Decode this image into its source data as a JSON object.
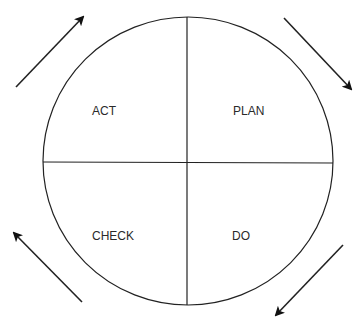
{
  "diagram": {
    "quadrants": [
      {
        "id": "act",
        "label": "ACT",
        "x": 92,
        "y": 115
      },
      {
        "id": "plan",
        "label": "PLAN",
        "x": 233,
        "y": 115
      },
      {
        "id": "check",
        "label": "CHECK",
        "x": 92,
        "y": 240
      },
      {
        "id": "do",
        "label": "DO",
        "x": 232,
        "y": 240
      }
    ],
    "circle": {
      "cx": 188,
      "cy": 161,
      "rx": 145,
      "ry": 144
    },
    "arrows": [
      {
        "id": "act-to-plan",
        "from": [
          16,
          87
        ],
        "to": [
          83,
          16
        ]
      },
      {
        "id": "plan-to-do",
        "from": [
          284,
          18
        ],
        "to": [
          352,
          90
        ]
      },
      {
        "id": "do-to-check",
        "from": [
          343,
          245
        ],
        "to": [
          275,
          316
        ]
      },
      {
        "id": "check-to-act",
        "from": [
          82,
          302
        ],
        "to": [
          13,
          232
        ]
      }
    ],
    "colors": {
      "line": "#222222",
      "text": "#2a2a2a",
      "background": "#ffffff"
    }
  }
}
